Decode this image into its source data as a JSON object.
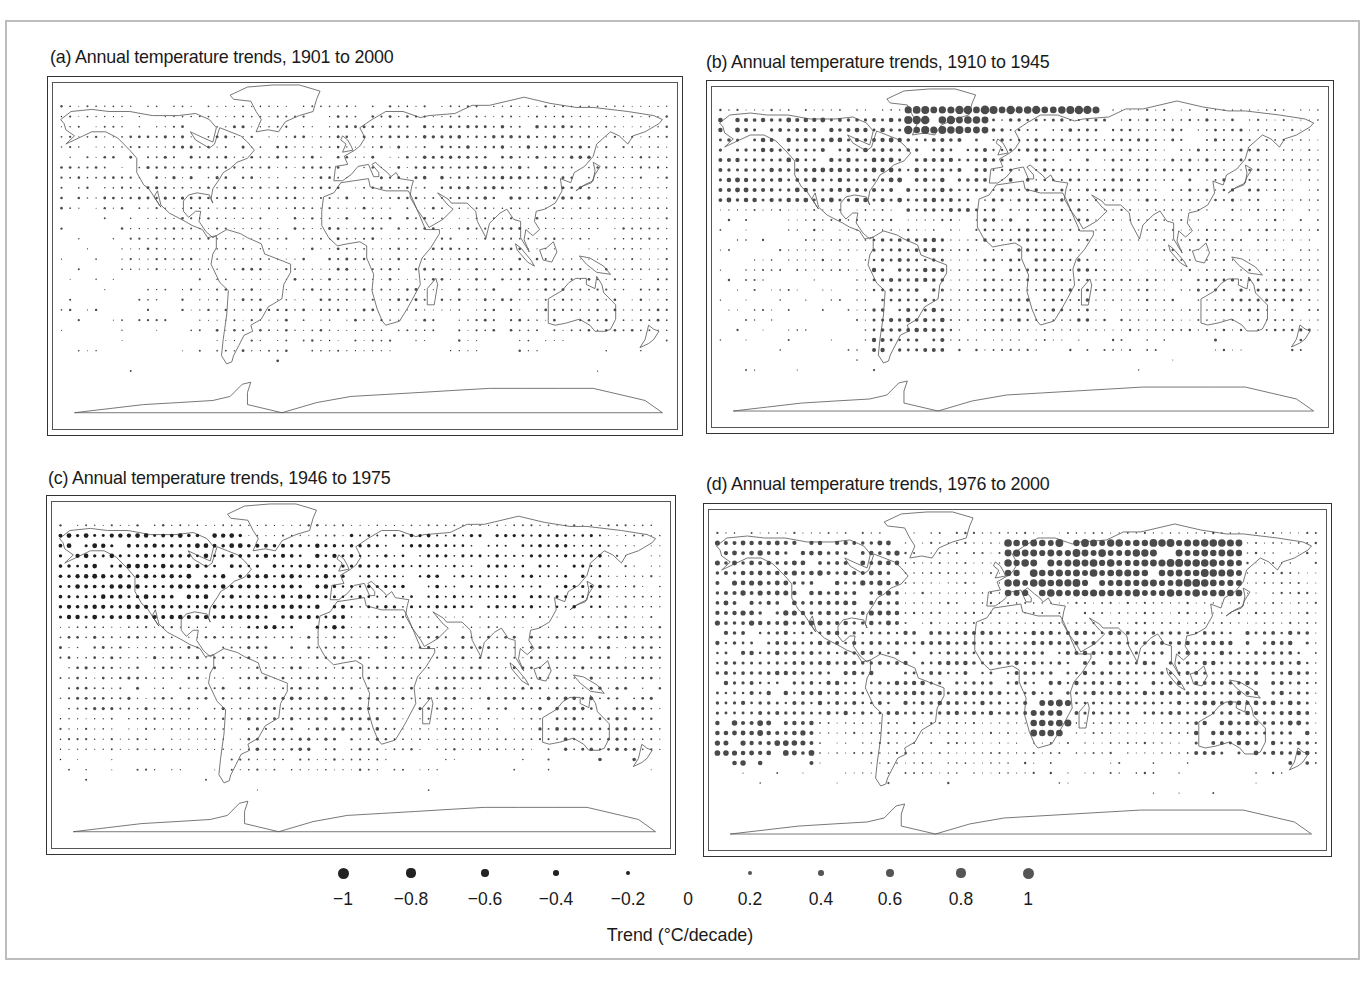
{
  "figure": {
    "panels": [
      {
        "id": "a",
        "title": "(a) Annual temperature trends, 1901 to 2000",
        "title_pos": [
          50,
          46
        ],
        "frame": [
          47,
          76,
          636,
          360
        ]
      },
      {
        "id": "b",
        "title": "(b) Annual temperature trends, 1910 to 1945",
        "title_pos": [
          706,
          51
        ],
        "frame": [
          706,
          80,
          628,
          354
        ]
      },
      {
        "id": "c",
        "title": "(c) Annual temperature trends, 1946 to 1975",
        "title_pos": [
          48,
          467
        ],
        "frame": [
          46,
          495,
          630,
          360
        ]
      },
      {
        "id": "d",
        "title": "(d) Annual temperature trends, 1976 to 2000",
        "title_pos": [
          706,
          473
        ],
        "frame": [
          703,
          503,
          629,
          354
        ]
      }
    ],
    "legend": {
      "title": "Trend (°C/decade)",
      "items": [
        {
          "label": "−1",
          "value": -1,
          "x": 43
        },
        {
          "label": "−0.8",
          "value": -0.8,
          "x": 111
        },
        {
          "label": "−0.6",
          "value": -0.6,
          "x": 185
        },
        {
          "label": "−0.4",
          "value": -0.4,
          "x": 256
        },
        {
          "label": "−0.2",
          "value": -0.2,
          "x": 328
        },
        {
          "label": "0",
          "value": 0,
          "x": 388
        },
        {
          "label": "0.2",
          "value": 0.2,
          "x": 450
        },
        {
          "label": "0.4",
          "value": 0.4,
          "x": 521
        },
        {
          "label": "0.6",
          "value": 0.6,
          "x": 590
        },
        {
          "label": "0.8",
          "value": 0.8,
          "x": 661
        },
        {
          "label": "1",
          "value": 1,
          "x": 728
        }
      ]
    }
  },
  "chart_data": [
    {
      "type": "scatter",
      "title": "(a) Annual temperature trends, 1901 to 2000",
      "encoding": "dot size ∝ |trend|; dark = negative, gray = positive",
      "legend_title": "Trend (°C/decade)",
      "legend_values": [
        -1,
        -0.8,
        -0.6,
        -0.4,
        -0.2,
        0,
        0.2,
        0.4,
        0.6,
        0.8,
        1
      ],
      "regions": [
        {
          "name": "North America",
          "lon": [
            -130,
            -60
          ],
          "lat": [
            25,
            65
          ],
          "trend": 0.15
        },
        {
          "name": "North Pacific",
          "lon": [
            -180,
            -130
          ],
          "lat": [
            20,
            55
          ],
          "trend": 0.1
        },
        {
          "name": "Atlantic",
          "lon": [
            -60,
            -10
          ],
          "lat": [
            -40,
            60
          ],
          "trend": 0.1
        },
        {
          "name": "Europe",
          "lon": [
            -10,
            40
          ],
          "lat": [
            35,
            70
          ],
          "trend": 0.12
        },
        {
          "name": "Asia",
          "lon": [
            40,
            140
          ],
          "lat": [
            25,
            65
          ],
          "trend": 0.2
        },
        {
          "name": "Africa",
          "lon": [
            -15,
            50
          ],
          "lat": [
            -35,
            35
          ],
          "trend": 0.12
        },
        {
          "name": "South America",
          "lon": [
            -80,
            -35
          ],
          "lat": [
            -55,
            10
          ],
          "trend": 0.1
        },
        {
          "name": "Indian Ocean",
          "lon": [
            50,
            110
          ],
          "lat": [
            -40,
            20
          ],
          "trend": 0.1
        },
        {
          "name": "Australia",
          "lon": [
            110,
            180
          ],
          "lat": [
            -45,
            -10
          ],
          "trend": 0.1
        },
        {
          "name": "Tropical Pacific",
          "lon": [
            -180,
            -80
          ],
          "lat": [
            -30,
            20
          ],
          "trend": 0.06
        }
      ]
    },
    {
      "type": "scatter",
      "title": "(b) Annual temperature trends, 1910 to 1945",
      "regions": [
        {
          "name": "Arctic/Greenland",
          "lon": [
            -60,
            60
          ],
          "lat": [
            60,
            80
          ],
          "trend": 0.8
        },
        {
          "name": "North America",
          "lon": [
            -170,
            -60
          ],
          "lat": [
            25,
            70
          ],
          "trend": 0.35
        },
        {
          "name": "North Atlantic",
          "lon": [
            -60,
            0
          ],
          "lat": [
            20,
            60
          ],
          "trend": 0.3
        },
        {
          "name": "Europe",
          "lon": [
            -10,
            40
          ],
          "lat": [
            35,
            70
          ],
          "trend": 0.2
        },
        {
          "name": "Asia",
          "lon": [
            40,
            150
          ],
          "lat": [
            25,
            70
          ],
          "trend": 0.15
        },
        {
          "name": "South America",
          "lon": [
            -80,
            -35
          ],
          "lat": [
            -55,
            10
          ],
          "trend": 0.3
        },
        {
          "name": "Africa",
          "lon": [
            -15,
            50
          ],
          "lat": [
            -35,
            35
          ],
          "trend": 0.2
        },
        {
          "name": "Australia",
          "lon": [
            110,
            180
          ],
          "lat": [
            -45,
            -10
          ],
          "trend": 0.15
        }
      ]
    },
    {
      "type": "scatter",
      "title": "(c) Annual temperature trends, 1946 to 1975",
      "regions": [
        {
          "name": "North America",
          "lon": [
            -170,
            -60
          ],
          "lat": [
            25,
            70
          ],
          "trend": -0.35
        },
        {
          "name": "North Atlantic",
          "lon": [
            -60,
            0
          ],
          "lat": [
            20,
            65
          ],
          "trend": -0.3
        },
        {
          "name": "Europe/Asia",
          "lon": [
            0,
            150
          ],
          "lat": [
            30,
            70
          ],
          "trend": -0.2
        },
        {
          "name": "Tropics",
          "lon": [
            -180,
            180
          ],
          "lat": [
            -20,
            20
          ],
          "trend": 0.15
        },
        {
          "name": "South Atlantic",
          "lon": [
            -60,
            20
          ],
          "lat": [
            -40,
            -10
          ],
          "trend": 0.2
        },
        {
          "name": "Antarctic Peninsula",
          "lon": [
            -65,
            -55
          ],
          "lat": [
            -65,
            -60
          ],
          "trend": 0.9
        },
        {
          "name": "Australia",
          "lon": [
            110,
            180
          ],
          "lat": [
            -45,
            -10
          ],
          "trend": 0.2
        }
      ]
    },
    {
      "type": "scatter",
      "title": "(d) Annual temperature trends, 1976 to 2000",
      "regions": [
        {
          "name": "Northern Eurasia",
          "lon": [
            0,
            140
          ],
          "lat": [
            40,
            70
          ],
          "trend": 0.7
        },
        {
          "name": "North America",
          "lon": [
            -170,
            -60
          ],
          "lat": [
            25,
            70
          ],
          "trend": 0.4
        },
        {
          "name": "Tropics",
          "lon": [
            -180,
            180
          ],
          "lat": [
            -20,
            25
          ],
          "trend": 0.3
        },
        {
          "name": "South Pacific",
          "lon": [
            -180,
            -110
          ],
          "lat": [
            -45,
            -20
          ],
          "trend": 0.45
        },
        {
          "name": "Southern Africa",
          "lon": [
            15,
            40
          ],
          "lat": [
            -30,
            -10
          ],
          "trend": 0.6
        },
        {
          "name": "Australia",
          "lon": [
            110,
            180
          ],
          "lat": [
            -45,
            -10
          ],
          "trend": 0.35
        },
        {
          "name": "Antarctic Peninsula",
          "lon": [
            -65,
            -55
          ],
          "lat": [
            -65,
            -60
          ],
          "trend": 0.9
        }
      ]
    }
  ]
}
